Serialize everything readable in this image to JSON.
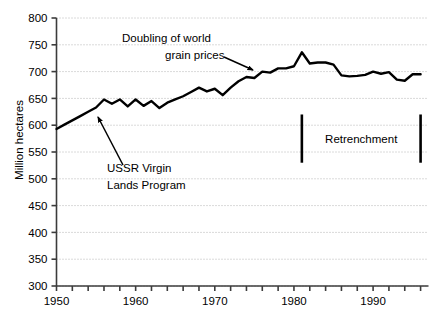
{
  "chart_data": {
    "type": "line",
    "title": "",
    "xlabel": "",
    "ylabel": "Million hectares",
    "ylim": [
      300,
      800
    ],
    "xlim": [
      1950,
      1997
    ],
    "yticks": [
      300,
      350,
      400,
      450,
      500,
      550,
      600,
      650,
      700,
      750,
      800
    ],
    "xticks": [
      1950,
      1952,
      1954,
      1956,
      1958,
      1960,
      1962,
      1964,
      1966,
      1968,
      1970,
      1972,
      1974,
      1976,
      1978,
      1980,
      1982,
      1984,
      1986,
      1988,
      1990,
      1992,
      1994,
      1996
    ],
    "xtick_labels": [
      "1950",
      "",
      "",
      "",
      "",
      "1960",
      "",
      "",
      "",
      "",
      "1970",
      "",
      "",
      "",
      "",
      "1980",
      "",
      "",
      "",
      "",
      "1990",
      "",
      "",
      ""
    ],
    "grid": "horizontal-dotted",
    "legend": "none",
    "series": [
      {
        "name": "World grain harvested area",
        "x": [
          1950,
          1951,
          1952,
          1953,
          1954,
          1955,
          1956,
          1957,
          1958,
          1959,
          1960,
          1961,
          1962,
          1963,
          1964,
          1965,
          1966,
          1967,
          1968,
          1969,
          1970,
          1971,
          1972,
          1973,
          1974,
          1975,
          1976,
          1977,
          1978,
          1979,
          1980,
          1981,
          1982,
          1983,
          1984,
          1985,
          1986,
          1987,
          1988,
          1989,
          1990,
          1991,
          1992,
          1993,
          1994,
          1995,
          1996
        ],
        "values": [
          593,
          601,
          609,
          617,
          625,
          633,
          648,
          640,
          648,
          635,
          648,
          636,
          645,
          632,
          642,
          648,
          654,
          662,
          670,
          663,
          668,
          656,
          670,
          682,
          690,
          688,
          700,
          698,
          706,
          706,
          710,
          736,
          715,
          717,
          717,
          713,
          693,
          691,
          692,
          694,
          700,
          696,
          699,
          685,
          683,
          695,
          695
        ]
      }
    ],
    "annotations": [
      {
        "id": "grain-prices",
        "text_lines": [
          "Doubling of world",
          "grain prices"
        ],
        "arrow_from": {
          "x": 224,
          "y": 57
        },
        "arrow_to": {
          "x": 253,
          "y": 70
        }
      },
      {
        "id": "ussr-virgin-lands",
        "text_lines": [
          "USSR Virgin",
          "Lands Program"
        ],
        "arrow_from": {
          "x": 123,
          "y": 165
        },
        "arrow_to": {
          "x": 98,
          "y": 117
        }
      },
      {
        "id": "retrenchment",
        "text_lines": [
          "Retrenchment"
        ],
        "marker_left_year": 1981,
        "marker_right_year": 1996,
        "marker_top_value": 620,
        "marker_bottom_value": 530
      }
    ]
  },
  "axis": {
    "y_tick_labels": [
      "800",
      "750",
      "700",
      "650",
      "600",
      "550",
      "500",
      "450",
      "400",
      "350",
      "300"
    ],
    "x_tick_labels": [
      "1950",
      "1960",
      "1970",
      "1980",
      "1990"
    ],
    "y_axis_title": "Million hectares"
  },
  "annotations": {
    "grain_prices_line1": "Doubling of world",
    "grain_prices_line2": "grain prices",
    "ussr_line1": "USSR Virgin",
    "ussr_line2": "Lands Program",
    "retrenchment_label": "Retrenchment"
  },
  "colors": {
    "line": "#000000",
    "grid": "#b4b4b4",
    "axis": "#3c3c3c",
    "background": "#ffffff",
    "text": "#000000"
  }
}
